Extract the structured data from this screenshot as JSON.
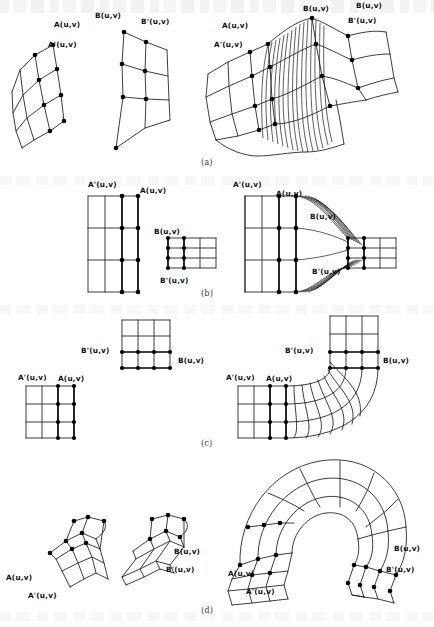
{
  "figure": {
    "kind": "scanned-textbook-figure",
    "subfigures": [
      {
        "caption": "(a)",
        "panels": [
          {
            "role": "source-patch-a",
            "labels": [
              "A(u,v)",
              "A'(u,v)"
            ]
          },
          {
            "role": "source-patch-b",
            "labels": [
              "B(u,v)",
              "B'(u,v)"
            ]
          },
          {
            "role": "blended-result",
            "labels": [
              "A(u,v)",
              "A'(u,v)",
              "B(u,v)",
              "B'(u,v)"
            ]
          }
        ]
      },
      {
        "caption": "(b)",
        "panels": [
          {
            "role": "source-patch-a",
            "labels": [
              "A'(u,v)",
              "A(u,v)"
            ]
          },
          {
            "role": "source-patch-b",
            "labels": [
              "B(u,v)",
              "B'(u,v)"
            ]
          },
          {
            "role": "blended-result",
            "labels": [
              "A'(u,v)",
              "A(u,v)",
              "B(u,v)",
              "B'(u,v)"
            ]
          }
        ]
      },
      {
        "caption": "(c)",
        "panels": [
          {
            "role": "source-patch-b",
            "labels": [
              "B'(u,v)",
              "B(u,v)"
            ]
          },
          {
            "role": "source-patch-a",
            "labels": [
              "A'(u,v)",
              "A(u,v)"
            ]
          },
          {
            "role": "blended-result",
            "labels": [
              "B'(u,v)",
              "B(u,v)",
              "A'(u,v)",
              "A(u,v)"
            ]
          }
        ]
      },
      {
        "caption": "(d)",
        "panels": [
          {
            "role": "source-patch-a",
            "labels": [
              "A(u,v)",
              "A'(u,v)"
            ]
          },
          {
            "role": "source-patch-b",
            "labels": [
              "B(u,v)",
              "B'(u,v)"
            ]
          },
          {
            "role": "blended-result",
            "labels": [
              "A(u,v)",
              "A'(u,v)",
              "B(u,v)",
              "B'(u,v)"
            ]
          }
        ]
      }
    ],
    "labels": {
      "a": "A(u,v)",
      "a_prime": "A'(u,v)",
      "b": "B(u,v)",
      "b_prime": "B'(u,v)"
    },
    "captions": {
      "a": "(a)",
      "b": "(b)",
      "c": "(c)",
      "d": "(d)"
    },
    "colors": {
      "ink": "#1a1a1a",
      "paper": "#ffffff",
      "caption": "#444444"
    },
    "top_ghost_label": "B(u,v)"
  }
}
